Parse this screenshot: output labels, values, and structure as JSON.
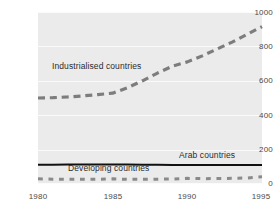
{
  "chart_data": {
    "type": "line",
    "title": "",
    "subtitle": "",
    "xlabel": "",
    "ylabel": "",
    "xlim": [
      1980,
      1995
    ],
    "ylim": [
      0,
      1000
    ],
    "grid": true,
    "legend_position": "inline-annotations",
    "x": [
      1980,
      1981,
      1982,
      1983,
      1984,
      1985,
      1986,
      1987,
      1988,
      1989,
      1990,
      1991,
      1992,
      1993,
      1994,
      1995
    ],
    "yticks": [
      "0",
      "200",
      "400",
      "600",
      "800",
      "1000"
    ],
    "ytick_values": [
      0,
      200,
      400,
      600,
      800,
      1000
    ],
    "xticks": [
      "1980",
      "1985",
      "1990",
      "1995"
    ],
    "xtick_values": [
      1980,
      1985,
      1990,
      1995
    ],
    "series": [
      {
        "name": "Industrialised countries",
        "style": "dashed",
        "color": "#7d7d7d",
        "width": 3.2,
        "values": [
          500,
          502,
          506,
          512,
          520,
          528,
          560,
          600,
          645,
          685,
          710,
          745,
          785,
          825,
          870,
          915
        ]
      },
      {
        "name": "Arab countries",
        "style": "solid",
        "color": "#111111",
        "width": 2.0,
        "values": [
          112,
          112,
          113,
          113,
          114,
          114,
          113,
          112,
          112,
          111,
          111,
          110,
          110,
          110,
          110,
          110
        ]
      },
      {
        "name": "Developing countries",
        "style": "dotted",
        "color": "#8a8a8a",
        "width": 3.0,
        "values": [
          30,
          28,
          27,
          27,
          27,
          30,
          27,
          27,
          28,
          29,
          33,
          31,
          32,
          33,
          35,
          42
        ]
      }
    ],
    "annotations": [
      {
        "text": "Industrialised countries",
        "x": 1981.0,
        "y": 640
      },
      {
        "text": "Arab countries",
        "x": 1990.6,
        "y": 165
      },
      {
        "text": "Developing countries",
        "x": 1982.0,
        "y": 88
      }
    ]
  },
  "colors": {
    "plot_background": "#ebebeb",
    "page_background": "#ffffff",
    "gridline": "#fbfbfb",
    "axis_text": "#4a4a4a",
    "annotation_text": "#2b2b2b",
    "industrialised": "#7d7d7d",
    "arab": "#111111",
    "developing": "#8a8a8a"
  }
}
